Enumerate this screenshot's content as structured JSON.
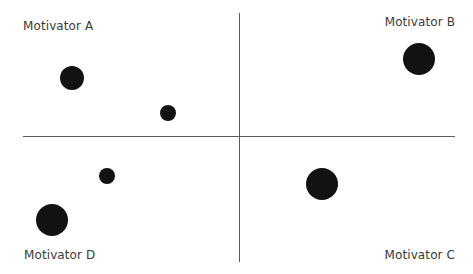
{
  "chart_data": {
    "type": "scatter",
    "subtype": "bubble-quadrant",
    "title": "",
    "xlabel": "",
    "ylabel": "",
    "grid": false,
    "legend": null,
    "axes": {
      "x_range_px": [
        23,
        455
      ],
      "y_range_px": [
        13,
        262
      ],
      "origin_px": [
        240,
        137
      ]
    },
    "quadrant_labels": {
      "top_left": "Motivator A",
      "top_right": "Motivator B",
      "bottom_right": "Motivator C",
      "bottom_left": "Motivator D"
    },
    "points": [
      {
        "x": 72,
        "y": 78,
        "size": 24,
        "quadrant": "Motivator A"
      },
      {
        "x": 168,
        "y": 113,
        "size": 16,
        "quadrant": "Motivator A"
      },
      {
        "x": 419,
        "y": 59,
        "size": 32,
        "quadrant": "Motivator B"
      },
      {
        "x": 322,
        "y": 184,
        "size": 32,
        "quadrant": "Motivator C"
      },
      {
        "x": 107,
        "y": 176,
        "size": 16,
        "quadrant": "Motivator D"
      },
      {
        "x": 52,
        "y": 220,
        "size": 32,
        "quadrant": "Motivator D"
      }
    ],
    "colors": {
      "bubble": "#121212",
      "axis": "#5a5a5a",
      "label": "#3a3a3a"
    }
  },
  "labels": {
    "a": "Motivator A",
    "b": "Motivator B",
    "c": "Motivator C",
    "d": "Motivator D"
  }
}
